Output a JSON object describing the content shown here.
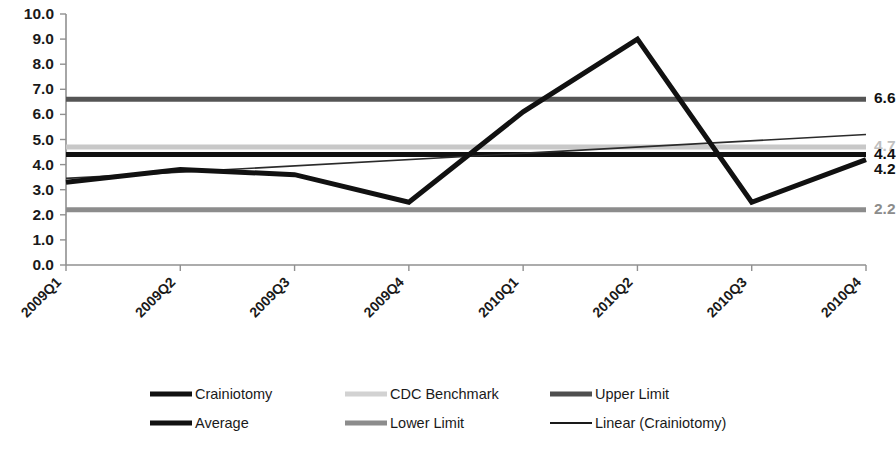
{
  "chart_data": {
    "type": "line",
    "title": "",
    "xlabel": "",
    "ylabel": "",
    "categories": [
      "2009Q1",
      "2009Q2",
      "2009Q3",
      "2009Q4",
      "2010Q1",
      "2010Q2",
      "2010Q3",
      "2010Q4"
    ],
    "ylim": [
      0.0,
      10.0
    ],
    "yticks": [
      "0.0",
      "1.0",
      "2.0",
      "3.0",
      "4.0",
      "5.0",
      "6.0",
      "7.0",
      "8.0",
      "9.0",
      "10.0"
    ],
    "ytick_values": [
      0.0,
      1.0,
      2.0,
      3.0,
      4.0,
      5.0,
      6.0,
      7.0,
      8.0,
      9.0,
      10.0
    ],
    "grid": false,
    "legend_position": "bottom",
    "series": [
      {
        "name": "Crainiotomy",
        "type": "line",
        "color": "#111111",
        "width": 5,
        "values": [
          3.3,
          3.8,
          3.6,
          2.5,
          6.1,
          9.0,
          2.5,
          4.2
        ]
      },
      {
        "name": "CDC Benchmark",
        "type": "constant",
        "color": "#c8c8c8",
        "width": 5,
        "value": 4.7,
        "end_label": "4.7"
      },
      {
        "name": "Upper Limit",
        "type": "constant",
        "color": "#555555",
        "width": 5,
        "value": 6.6,
        "end_label": "6.6"
      },
      {
        "name": "Average",
        "type": "constant",
        "color": "#111111",
        "width": 5,
        "value": 4.4,
        "end_label": "4.4"
      },
      {
        "name": "Lower Limit",
        "type": "constant",
        "color": "#8c8c8c",
        "width": 5,
        "value": 2.2,
        "end_label": "2.2"
      },
      {
        "name": "Linear (Crainiotomy)",
        "type": "trendline",
        "color": "#2b2b2b",
        "width": 1.6,
        "start": 3.45,
        "end": 5.2
      }
    ],
    "end_labels": [
      {
        "text": "6.6",
        "value": 6.6,
        "color": "#111111"
      },
      {
        "text": "4.7",
        "value": 4.7,
        "color": "#c0c0c0"
      },
      {
        "text": "4.4",
        "value": 4.4,
        "color": "#111111"
      },
      {
        "text": "4.2",
        "value": 3.8,
        "color": "#111111"
      },
      {
        "text": "2.2",
        "value": 2.2,
        "color": "#8c8c8c"
      }
    ],
    "legend": [
      {
        "label": "Crainiotomy",
        "color": "#111111",
        "width": 5
      },
      {
        "label": "CDC Benchmark",
        "color": "#d2d2d2",
        "width": 5
      },
      {
        "label": "Upper Limit",
        "color": "#4f4f4f",
        "width": 5
      },
      {
        "label": "Average",
        "color": "#111111",
        "width": 5
      },
      {
        "label": "Lower Limit",
        "color": "#8c8c8c",
        "width": 5
      },
      {
        "label": "Linear (Crainiotomy)",
        "color": "#1a1a1a",
        "width": 2
      }
    ]
  }
}
